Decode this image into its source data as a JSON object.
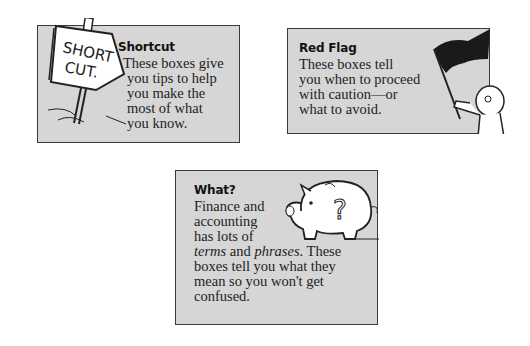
{
  "boxes": [
    {
      "id": "shortcut",
      "title": "Shortcut",
      "lines": [
        "These boxes give",
        "you tips to help",
        "you make the",
        "most of what",
        "you know."
      ],
      "icon": "signpost-icon",
      "sign_text": [
        "SHORT",
        "CUT."
      ]
    },
    {
      "id": "red-flag",
      "title": "Red Flag",
      "lines": [
        "These boxes tell",
        "you when to proceed",
        "with caution—or",
        "what to avoid."
      ],
      "icon": "flag-waver-icon"
    },
    {
      "id": "what",
      "title": "What?",
      "lines": [
        "Finance and",
        "accounting",
        "has lots of"
      ],
      "line4": {
        "t1": "terms",
        "t2": " and ",
        "t3": "phrases",
        "t4": ". These"
      },
      "lines_after": [
        "boxes tell you what they",
        "mean so you won't get",
        "confused."
      ],
      "icon": "piggy-bank-question-icon"
    }
  ],
  "colors": {
    "box_fill": "#d6d6d6",
    "border": "#3a3a3a",
    "flag": "#1a1a1a"
  }
}
